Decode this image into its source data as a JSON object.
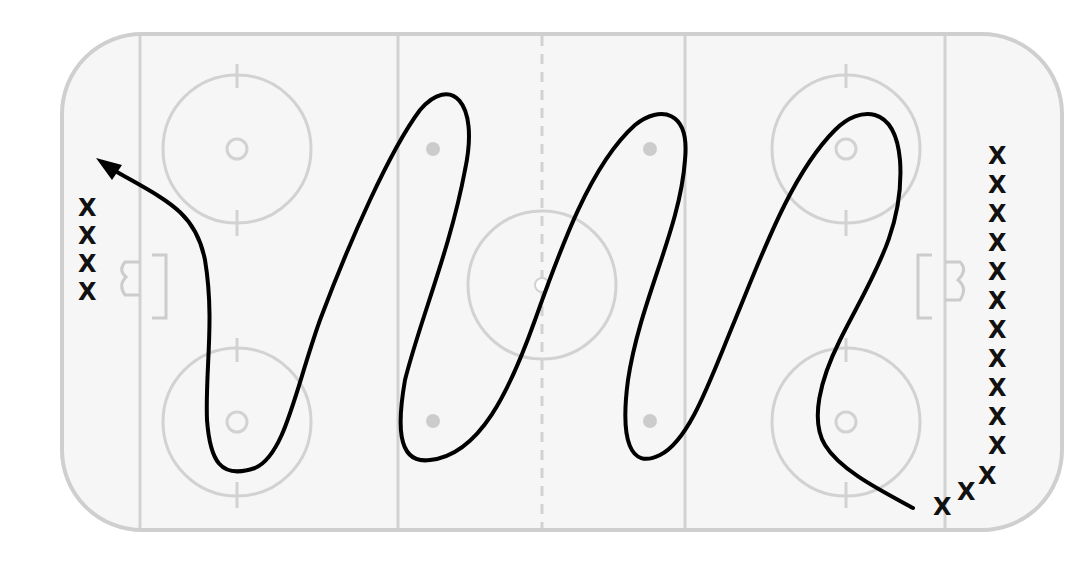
{
  "diagram": {
    "type": "hockey-drill",
    "title": "",
    "colors": {
      "rink_lines": "#cfcfcf",
      "rink_fill": "#f6f6f6",
      "skating_path": "#000000",
      "player_marks": "#111111",
      "faceoff_dots": "#cccccc"
    },
    "player_symbol": "X",
    "left_group": {
      "label": "X",
      "count": 4
    },
    "right_group": {
      "label": "X",
      "count_vertical": 11,
      "count_diagonal": 3
    },
    "path_description": "Skater starts at bottom-right, weaves in S-curves across full ice through all zones, and exits with arrow toward top-left corner"
  }
}
